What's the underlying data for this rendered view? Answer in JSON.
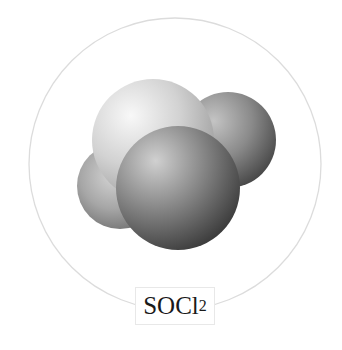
{
  "figure": {
    "label": {
      "formula_main": "SOCl",
      "formula_subscript": "2"
    },
    "enclosing_circle": {
      "cx": 175,
      "cy": 164,
      "r": 146,
      "stroke": "#dcdcdc"
    },
    "model_type": "space-filling",
    "atoms": [
      {
        "name": "oxygen-left",
        "cx": 120,
        "cy": 186,
        "r": 43,
        "base": "#a8a8a8",
        "highlight": "#d8d8d8",
        "shadow": "#6e6e6e"
      },
      {
        "name": "chlorine-back-right",
        "cx": 228,
        "cy": 140,
        "r": 48,
        "base": "#8a8a8a",
        "highlight": "#c8c8c8",
        "shadow": "#3e3e3e"
      },
      {
        "name": "sulfur-top",
        "cx": 153,
        "cy": 140,
        "r": 61,
        "base": "#d6d6d6",
        "highlight": "#f6f6f6",
        "shadow": "#9a9a9a"
      },
      {
        "name": "chlorine-front",
        "cx": 178,
        "cy": 188,
        "r": 62,
        "base": "#888888",
        "highlight": "#cfcfcf",
        "shadow": "#3a3a3a"
      }
    ]
  }
}
